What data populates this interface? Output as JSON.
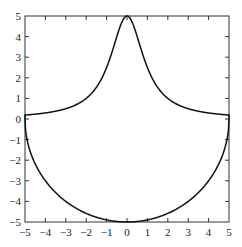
{
  "chart_data": {
    "type": "line",
    "title": "",
    "xlabel": "",
    "ylabel": "",
    "xlim": [
      -5,
      5
    ],
    "ylim": [
      -5,
      5
    ],
    "grid": false,
    "legend": null,
    "x_ticks": [
      -5,
      -4,
      -3,
      -2,
      -1,
      0,
      1,
      2,
      3,
      4,
      5
    ],
    "y_ticks": [
      -5,
      -4,
      -3,
      -2,
      -1,
      0,
      1,
      2,
      3,
      4,
      5
    ],
    "x_tick_labels": [
      "−5",
      "−4",
      "−3",
      "−2",
      "−1",
      "0",
      "1",
      "2",
      "3",
      "4",
      "5"
    ],
    "y_tick_labels": [
      "−5",
      "−4",
      "−3",
      "−2",
      "−1",
      "0",
      "1",
      "2",
      "3",
      "4",
      "5"
    ],
    "series": [
      {
        "name": "upper curve",
        "description": "bell-shaped curve approx y = 5/(1+x^2)",
        "x": [
          -5,
          -4,
          -3,
          -2,
          -1,
          -0.5,
          0,
          0.5,
          1,
          2,
          3,
          4,
          5
        ],
        "y": [
          0.19,
          0.29,
          0.5,
          1.0,
          2.5,
          4.0,
          5.0,
          4.0,
          2.5,
          1.0,
          0.5,
          0.29,
          0.19
        ]
      },
      {
        "name": "lower curve",
        "description": "lower semicircle y = -sqrt(25 - x^2)",
        "x": [
          -5,
          -4,
          -3,
          -2,
          -1,
          0,
          1,
          2,
          3,
          4,
          5
        ],
        "y": [
          0,
          -3,
          -4,
          -4.58,
          -4.9,
          -5,
          -4.9,
          -4.58,
          -4,
          -3,
          0
        ]
      }
    ],
    "line_color": "#111111"
  }
}
